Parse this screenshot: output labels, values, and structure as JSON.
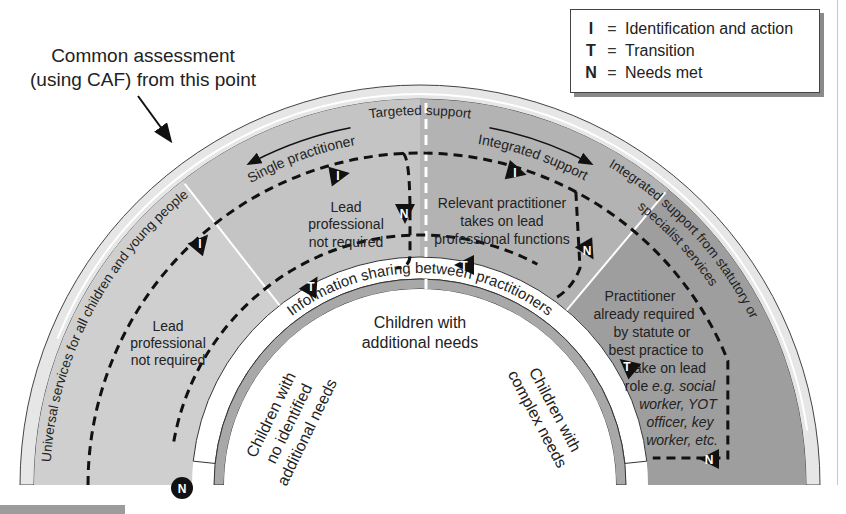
{
  "legend": {
    "items": [
      {
        "key": "I",
        "eq": "=",
        "desc": "Identification and action"
      },
      {
        "key": "T",
        "eq": "=",
        "desc": "Transition"
      },
      {
        "key": "N",
        "eq": "=",
        "desc": "Needs met"
      }
    ]
  },
  "callout": {
    "line1": "Common assessment",
    "line2": "(using CAF) from this point"
  },
  "rings": {
    "outer_label": "Universal services for all children and young people",
    "outer_right_label_1": "Integrated support from statutory or",
    "outer_right_label_2": "specialist services",
    "targeted_support": "Targeted support",
    "single_practitioner": "Single practitioner",
    "integrated_support": "Integrated support",
    "info_band": "Information sharing between practitioners"
  },
  "regions": {
    "universal_text": [
      "Lead",
      "professional",
      "not required"
    ],
    "single_text": [
      "Lead",
      "professional",
      "not required"
    ],
    "integrated_text": [
      "Relevant practitioner",
      "takes on lead",
      "professional functions"
    ],
    "specialist_text": [
      "Practitioner",
      "already required",
      "by statute or",
      "best practice to",
      "take on lead"
    ],
    "specialist_text_mixed": {
      "prefix": "role ",
      "italic": "e.g. social"
    },
    "specialist_text_italic": [
      "worker, YOT",
      "officer, key",
      "worker, etc."
    ]
  },
  "inner": {
    "center_label": [
      "Children with",
      "additional needs"
    ],
    "left_label": [
      "Children with",
      "no identified",
      "additional needs"
    ],
    "right_label": [
      "Children with",
      "complex needs"
    ]
  },
  "markers": {
    "identification": "I",
    "transition": "T",
    "needs_met": "N"
  },
  "colors": {
    "universal": "#cfcfcf",
    "targeted_single": "#c4c4c4",
    "targeted_integrated": "#b3b3b3",
    "specialist": "#9e9e9e",
    "rim": "#e6e6e6",
    "marker": "#111111"
  }
}
